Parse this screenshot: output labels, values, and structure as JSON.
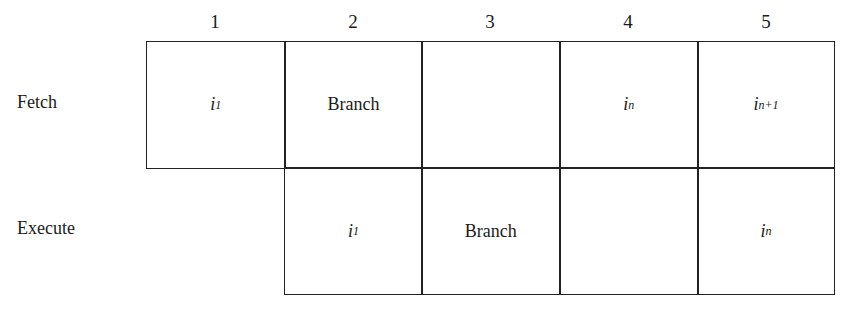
{
  "diagram": {
    "columns": [
      "1",
      "2",
      "3",
      "4",
      "5"
    ],
    "rows": [
      {
        "label": "Fetch",
        "cells": [
          {
            "col": 1,
            "base": "i",
            "sub": "1"
          },
          {
            "col": 2,
            "text": "Branch"
          },
          {
            "col": 3,
            "text": ""
          },
          {
            "col": 4,
            "base": "i",
            "sub": "n"
          },
          {
            "col": 5,
            "base": "i",
            "sub": "n+1"
          }
        ]
      },
      {
        "label": "Execute",
        "cells": [
          {
            "col": 2,
            "base": "i",
            "sub": "1"
          },
          {
            "col": 3,
            "text": "Branch"
          },
          {
            "col": 4,
            "text": ""
          },
          {
            "col": 5,
            "base": "i",
            "sub": "n"
          }
        ]
      }
    ]
  }
}
